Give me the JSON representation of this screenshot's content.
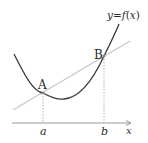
{
  "diagram": {
    "curve_label": "y=f(x)",
    "curve_label_parts": {
      "y": "y",
      "eq": "=",
      "f": "f",
      "lp": "(",
      "x": "x",
      "rp": ")"
    },
    "points": [
      {
        "name": "A",
        "x_label": "a"
      },
      {
        "name": "B",
        "x_label": "b"
      }
    ],
    "axis_label": "x",
    "colors": {
      "curve": "#3a3a3a",
      "secant": "#c8c8c8",
      "axis": "#9a9a9a",
      "dashed": "#a0a0a0",
      "text": "#2a2a2a"
    }
  }
}
